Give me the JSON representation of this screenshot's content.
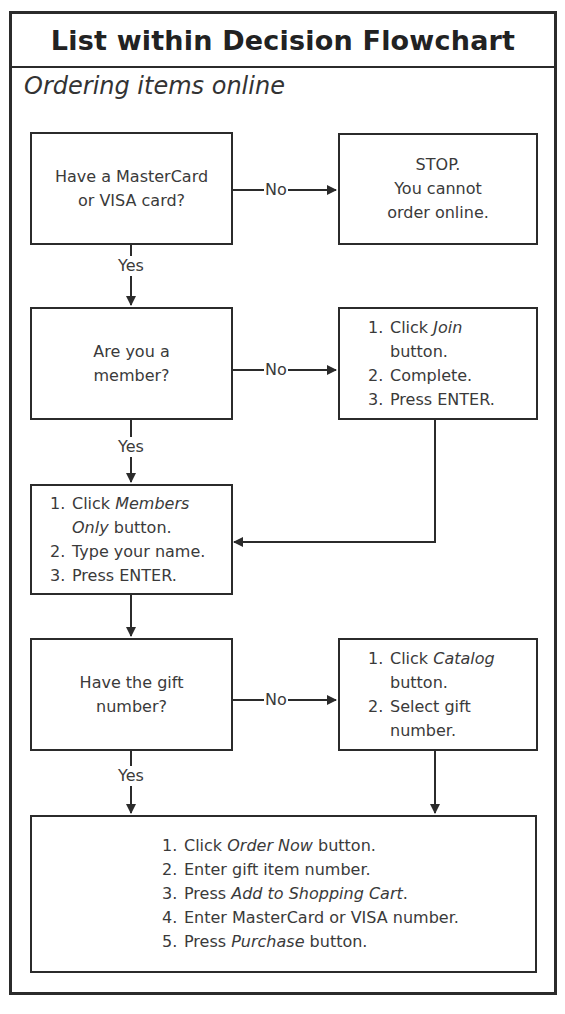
{
  "title": "List within Decision Flowchart",
  "subtitle": "Ordering items online",
  "colors": {
    "line": "#2b2b2b",
    "text": "#3a3a3a",
    "background": "#ffffff"
  },
  "nodes": {
    "q_card": {
      "type": "decision",
      "lines": [
        "Have a MasterCard",
        "or VISA card?"
      ]
    },
    "stop": {
      "type": "terminal",
      "lines": [
        "STOP.",
        "You cannot",
        "order online."
      ]
    },
    "q_member": {
      "type": "decision",
      "lines": [
        "Are you a",
        "member?"
      ]
    },
    "join_steps": {
      "type": "process",
      "steps": [
        {
          "num": "1.",
          "text_before": "Click ",
          "italic": "Join",
          "text_after": "",
          "cont": "button."
        },
        {
          "num": "2.",
          "text_before": "Complete.",
          "italic": "",
          "text_after": "",
          "cont": ""
        },
        {
          "num": "3.",
          "text_before": "Press ENTER.",
          "italic": "",
          "text_after": "",
          "cont": ""
        }
      ]
    },
    "member_steps": {
      "type": "process",
      "steps": [
        {
          "num": "1.",
          "text_before": "Click ",
          "italic": "Members",
          "text_after": "",
          "cont_italic": "Only",
          "cont": " button."
        },
        {
          "num": "2.",
          "text_before": "Type your name.",
          "italic": "",
          "text_after": ""
        },
        {
          "num": "3.",
          "text_before": "Press ENTER.",
          "italic": "",
          "text_after": ""
        }
      ]
    },
    "q_gift": {
      "type": "decision",
      "lines": [
        "Have the gift",
        "number?"
      ]
    },
    "catalog_steps": {
      "type": "process",
      "steps": [
        {
          "num": "1.",
          "text_before": "Click ",
          "italic": "Catalog",
          "text_after": "",
          "cont": "button."
        },
        {
          "num": "2.",
          "text_before": "Select gift",
          "italic": "",
          "text_after": "",
          "cont": "number."
        }
      ]
    },
    "order_steps": {
      "type": "process",
      "steps": [
        {
          "num": "1.",
          "text_before": "Click ",
          "italic": "Order Now",
          "text_after": " button."
        },
        {
          "num": "2.",
          "text_before": "Enter gift item number.",
          "italic": "",
          "text_after": ""
        },
        {
          "num": "3.",
          "text_before": "Press ",
          "italic": "Add to Shopping Cart",
          "text_after": "."
        },
        {
          "num": "4.",
          "text_before": "Enter MasterCard or VISA number.",
          "italic": "",
          "text_after": ""
        },
        {
          "num": "5.",
          "text_before": "Press ",
          "italic": "Purchase",
          "text_after": " button."
        }
      ]
    }
  },
  "edges": [
    {
      "from": "q_card",
      "to": "stop",
      "label": "No"
    },
    {
      "from": "q_card",
      "to": "q_member",
      "label": "Yes"
    },
    {
      "from": "q_member",
      "to": "join_steps",
      "label": "No"
    },
    {
      "from": "q_member",
      "to": "member_steps",
      "label": "Yes"
    },
    {
      "from": "join_steps",
      "to": "member_steps",
      "label": ""
    },
    {
      "from": "member_steps",
      "to": "q_gift",
      "label": ""
    },
    {
      "from": "q_gift",
      "to": "catalog_steps",
      "label": "No"
    },
    {
      "from": "q_gift",
      "to": "order_steps",
      "label": "Yes"
    },
    {
      "from": "catalog_steps",
      "to": "order_steps",
      "label": ""
    }
  ],
  "labels": {
    "no": "No",
    "yes": "Yes"
  }
}
